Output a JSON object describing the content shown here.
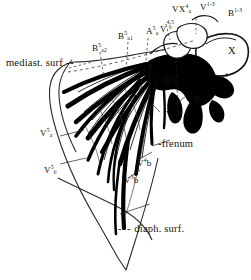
{
  "figure": {
    "surface_labels": [
      {
        "id": "mediastinal-surface",
        "text": "mediast. surf.",
        "leader": "dashed"
      },
      {
        "id": "diaphragmatic-surface",
        "text": "diaph. surf.",
        "leader": "dashed"
      },
      {
        "id": "frenum",
        "text": "frenum",
        "leader": "dashed"
      }
    ],
    "bronchus_labels": [
      {
        "id": "B5a2",
        "base": "B",
        "sup": "5",
        "sub": "a2"
      },
      {
        "id": "B5a1",
        "base": "B",
        "sup": "5",
        "sub": "a1"
      },
      {
        "id": "A5a",
        "base": "A",
        "sup": "5",
        "sub": "a"
      },
      {
        "id": "B1-3",
        "base": "B",
        "sup": "1-3",
        "sub": ""
      },
      {
        "id": "B6",
        "base": "B",
        "sup": "6",
        "sub": ""
      },
      {
        "id": "B7-10",
        "base": "B",
        "sup": "7-10",
        "sub": ""
      },
      {
        "id": "B5b",
        "base": "B",
        "sup": "5",
        "sub": "b"
      }
    ],
    "vein_labels": [
      {
        "id": "V4-5b",
        "base": "V",
        "sup": "4,5",
        "sub": "b"
      },
      {
        "id": "VX4a",
        "base": "VX",
        "sup": "4",
        "sub": "a"
      },
      {
        "id": "V1-3",
        "base": "V",
        "sup": "1-3",
        "sub": ""
      },
      {
        "id": "V5a",
        "base": "V",
        "sup": "5",
        "sub": "a"
      },
      {
        "id": "V5b",
        "base": "V",
        "sup": "5",
        "sub": "b"
      },
      {
        "id": "V4b",
        "base": "V",
        "sup": "4",
        "sub": "b"
      },
      {
        "id": "V3b",
        "base": "V",
        "sup": "3",
        "sub": "b"
      }
    ],
    "hilum_marker": {
      "id": "X",
      "text": "X"
    },
    "colors": {
      "ink": "#111111",
      "paper": "#ffffff",
      "vessel_fill": "#000000",
      "outline": "#2a2a2a"
    }
  }
}
